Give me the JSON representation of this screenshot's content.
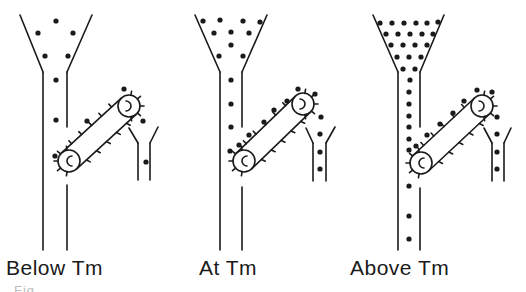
{
  "figure": {
    "type": "diagram",
    "panels": [
      {
        "id": "below",
        "label": "Below Tm",
        "label_x": 6,
        "funnel": {
          "tl": [
            20,
            15
          ],
          "tr": [
            92,
            15
          ],
          "nl": [
            43,
            72
          ],
          "nr": [
            67,
            72
          ],
          "left_wall_bottom": 250,
          "right_wall_gap": [
            127,
            185
          ],
          "right_wall_bottom": 250
        },
        "dots": [
          [
            56,
            21
          ],
          [
            38,
            33
          ],
          [
            73,
            33
          ],
          [
            45,
            56
          ],
          [
            68,
            56
          ],
          [
            56,
            80
          ],
          [
            56,
            120
          ]
        ],
        "conveyor": {
          "c1": [
            69,
            161
          ],
          "c2": [
            129,
            106
          ],
          "r": 11,
          "belt_dots": [
            [
              55,
              156
            ],
            [
              87,
              121
            ],
            [
              124,
              89
            ]
          ]
        },
        "collector": {
          "v_left": [
            129,
            128
          ],
          "v_right": [
            158,
            127
          ],
          "tube_left": 138,
          "tube_right": 150,
          "top": 143,
          "bottom": 180,
          "dots": [
            [
              143,
              121
            ],
            [
              146,
              162
            ]
          ]
        }
      },
      {
        "id": "at",
        "label": "At Tm",
        "label_x": 200,
        "funnel": {
          "tl": [
            195,
            15
          ],
          "tr": [
            267,
            15
          ],
          "nl": [
            220,
            72
          ],
          "nr": [
            242,
            72
          ],
          "left_wall_bottom": 250,
          "right_wall_gap": [
            127,
            187
          ],
          "right_wall_bottom": 250
        },
        "dots": [
          [
            203,
            21
          ],
          [
            220,
            20
          ],
          [
            243,
            21
          ],
          [
            260,
            22
          ],
          [
            214,
            33
          ],
          [
            231,
            32
          ],
          [
            249,
            33
          ],
          [
            231,
            45
          ],
          [
            219,
            56
          ],
          [
            243,
            56
          ],
          [
            231,
            80
          ],
          [
            231,
            104
          ],
          [
            231,
            127
          ],
          [
            230,
            151
          ]
        ],
        "conveyor": {
          "c1": [
            244,
            161
          ],
          "c2": [
            303,
            104
          ],
          "r": 11,
          "belt_dots": [
            [
              239,
              145
            ],
            [
              249,
              135
            ],
            [
              264,
              122
            ],
            [
              274,
              110
            ],
            [
              287,
              101
            ],
            [
              298,
              89
            ],
            [
              315,
              94
            ]
          ]
        },
        "collector": {
          "v_left": [
            306,
            128
          ],
          "v_right": [
            335,
            127
          ],
          "tube_left": 313,
          "tube_right": 326,
          "top": 143,
          "bottom": 181,
          "dots": [
            [
              321,
              117
            ],
            [
              320,
              134
            ],
            [
              320,
              152
            ],
            [
              320,
              169
            ]
          ]
        }
      },
      {
        "id": "above",
        "label": "Above Tm",
        "label_x": 352,
        "funnel": {
          "tl": [
            373,
            15
          ],
          "tr": [
            444,
            15
          ],
          "nl": [
            398,
            72
          ],
          "nr": [
            420,
            72
          ],
          "left_wall_bottom": 250,
          "right_wall_gap": [
            127,
            188
          ],
          "right_wall_bottom": 250
        },
        "dots": [
          [
            380,
            23
          ],
          [
            392,
            23
          ],
          [
            404,
            23
          ],
          [
            416,
            23
          ],
          [
            427,
            23
          ],
          [
            438,
            22
          ],
          [
            386,
            34
          ],
          [
            398,
            34
          ],
          [
            410,
            34
          ],
          [
            422,
            34
          ],
          [
            433,
            34
          ],
          [
            391,
            45
          ],
          [
            403,
            45
          ],
          [
            415,
            45
          ],
          [
            427,
            45
          ],
          [
            397,
            57
          ],
          [
            409,
            57
          ],
          [
            421,
            57
          ],
          [
            403,
            69
          ],
          [
            415,
            69
          ],
          [
            410,
            80
          ],
          [
            409,
            92
          ],
          [
            409,
            104
          ],
          [
            409,
            116
          ],
          [
            409,
            127
          ],
          [
            409,
            139
          ],
          [
            409,
            150
          ],
          [
            409,
            186
          ],
          [
            409,
            216
          ],
          [
            409,
            239
          ]
        ],
        "conveyor": {
          "c1": [
            421,
            163
          ],
          "c2": [
            482,
            106
          ],
          "r": 11,
          "belt_dots": [
            [
              416,
              146
            ],
            [
              427,
              135
            ],
            [
              440,
              124
            ],
            [
              453,
              113
            ],
            [
              464,
              101
            ],
            [
              477,
              90
            ],
            [
              492,
              92
            ]
          ]
        },
        "collector": {
          "v_left": [
            484,
            128
          ],
          "v_right": [
            511,
            128
          ],
          "tube_left": 492,
          "tube_right": 504,
          "top": 143,
          "bottom": 181,
          "dots": [
            [
              497,
              117
            ],
            [
              497,
              134
            ],
            [
              497,
              152
            ],
            [
              497,
              169
            ]
          ]
        }
      }
    ],
    "caption_fragment": "Fig. ... (caption text cut off, illegible)"
  }
}
